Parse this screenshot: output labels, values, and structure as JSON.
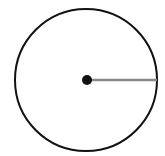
{
  "diagram": {
    "type": "circle-with-radius",
    "circle": {
      "cx": 86,
      "cy": 80,
      "r": 71,
      "stroke": "#111111",
      "stroke_width": 2
    },
    "center_point": {
      "cx": 87,
      "cy": 80,
      "r": 5,
      "fill": "#111111"
    },
    "radius_line": {
      "x1": 87,
      "y1": 80,
      "x2": 157,
      "y2": 80,
      "stroke": "#888888",
      "stroke_width": 2.5
    }
  }
}
